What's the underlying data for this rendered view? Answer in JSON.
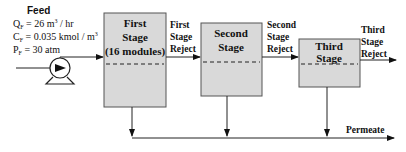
{
  "feed": {
    "title": "Feed",
    "flow": "Q",
    "flow_sub": "F",
    "flow_value": " = 26 m",
    "flow_unit_exp": "3",
    "flow_unit_rest": " / hr",
    "conc": "C",
    "conc_sub": "F",
    "conc_value": " = 0.035 kmol / m",
    "conc_unit_exp": "3",
    "pressure": "P",
    "pressure_sub": "F",
    "pressure_value": " = 30 atm"
  },
  "stages": [
    {
      "line1": "First",
      "line2": "Stage",
      "line3": "(16 modules)"
    },
    {
      "line1": "Second",
      "line2": "Stage"
    },
    {
      "line1": "Third",
      "line2": "Stage"
    }
  ],
  "rejects": [
    {
      "line1": "First",
      "line2": "Stage",
      "line3": "Reject"
    },
    {
      "line1": "Second",
      "line2": "Stage",
      "line3": "Reject"
    },
    {
      "line1": "Third",
      "line2": "Stage",
      "line3": "Reject"
    }
  ],
  "permeate_label": "Permeate",
  "colors": {
    "box_fill": "#d9d9d9",
    "box_stroke": "#555555",
    "line": "#222222"
  }
}
